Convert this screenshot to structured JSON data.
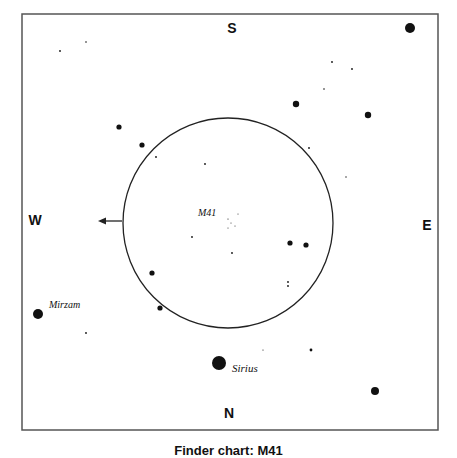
{
  "finder_chart": {
    "frame": {
      "x": 22,
      "y": 14,
      "width": 416,
      "height": 416,
      "stroke": "#555555"
    },
    "directions": {
      "south": {
        "label": "S",
        "x": 232,
        "y": 33
      },
      "north": {
        "label": "N",
        "x": 229,
        "y": 418
      },
      "west": {
        "label": "W",
        "x": 35,
        "y": 225
      },
      "east": {
        "label": "E",
        "x": 427,
        "y": 230
      }
    },
    "field_circle": {
      "cx": 228,
      "cy": 223,
      "r": 105,
      "stroke": "#222222"
    },
    "arrow": {
      "x1": 122,
      "y1": 221,
      "x2": 98,
      "y2": 221,
      "direction": "west"
    },
    "labels": [
      {
        "text": "M41",
        "x": 198,
        "y": 216
      },
      {
        "text": "Mirzam",
        "x": 49,
        "y": 308
      },
      {
        "text": "Sirius",
        "x": 232,
        "y": 372
      }
    ],
    "stars": [
      {
        "x": 410,
        "y": 28,
        "r": 5.0
      },
      {
        "x": 219,
        "y": 363,
        "r": 7.0,
        "name": "Sirius"
      },
      {
        "x": 38,
        "y": 314,
        "r": 5.0,
        "name": "Mirzam"
      },
      {
        "x": 375,
        "y": 391,
        "r": 4.0
      },
      {
        "x": 368,
        "y": 115,
        "r": 3.2
      },
      {
        "x": 296,
        "y": 104,
        "r": 3.2
      },
      {
        "x": 119,
        "y": 127,
        "r": 2.6
      },
      {
        "x": 142,
        "y": 145,
        "r": 2.6
      },
      {
        "x": 290,
        "y": 243,
        "r": 2.6
      },
      {
        "x": 306,
        "y": 245,
        "r": 2.6
      },
      {
        "x": 152,
        "y": 273,
        "r": 2.6
      },
      {
        "x": 160,
        "y": 308,
        "r": 2.6
      },
      {
        "x": 311,
        "y": 350,
        "r": 1.4
      },
      {
        "x": 60,
        "y": 51,
        "r": 0.9
      },
      {
        "x": 86,
        "y": 42,
        "r": 0.8
      },
      {
        "x": 332,
        "y": 62,
        "r": 0.9
      },
      {
        "x": 352,
        "y": 69,
        "r": 0.9
      },
      {
        "x": 324,
        "y": 89,
        "r": 0.8
      },
      {
        "x": 309,
        "y": 148,
        "r": 0.9
      },
      {
        "x": 346,
        "y": 177,
        "r": 0.7
      },
      {
        "x": 156,
        "y": 157,
        "r": 0.9
      },
      {
        "x": 205,
        "y": 164,
        "r": 0.9
      },
      {
        "x": 192,
        "y": 237,
        "r": 0.9
      },
      {
        "x": 232,
        "y": 253,
        "r": 0.9
      },
      {
        "x": 288,
        "y": 282,
        "r": 0.9
      },
      {
        "x": 288,
        "y": 286,
        "r": 0.9
      },
      {
        "x": 86,
        "y": 333,
        "r": 0.9
      },
      {
        "x": 263,
        "y": 350,
        "r": 0.6
      },
      {
        "x": 228,
        "y": 219,
        "r": 0.6
      },
      {
        "x": 231,
        "y": 223,
        "r": 0.5
      },
      {
        "x": 235,
        "y": 226,
        "r": 0.5
      },
      {
        "x": 228,
        "y": 228,
        "r": 0.5
      },
      {
        "x": 238,
        "y": 214,
        "r": 0.5
      }
    ]
  },
  "caption": "Finder chart: M41"
}
